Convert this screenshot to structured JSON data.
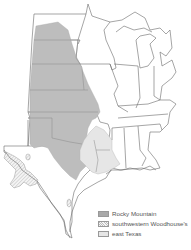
{
  "map": {
    "region": "Central and Eastern United States",
    "colors": {
      "background": "#ffffff",
      "state_border": "#6a6a6a",
      "rocky_mountain": "#bdbdbd",
      "southwestern_woodhouses": "#f0f0f0",
      "east_texas": "#e6e6e6"
    }
  },
  "legend": {
    "items": [
      {
        "label": "Rocky Mountain",
        "swatch": "solid-gray",
        "color": "#bdbdbd"
      },
      {
        "label": "southwestern Woodhouse's",
        "swatch": "hatched",
        "color": "#f0f0f0"
      },
      {
        "label": "east Texas",
        "swatch": "light-gray",
        "color": "#e6e6e6"
      }
    ]
  }
}
